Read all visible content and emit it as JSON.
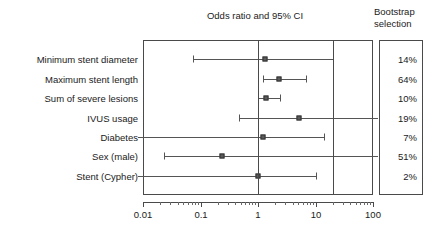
{
  "chart_data": {
    "type": "scatter",
    "subtype": "forest-plot",
    "title": "Odds ratio and 95% CI",
    "xlabel": "",
    "ylabel": "",
    "xscale": "log",
    "xlim": [
      0.01,
      100
    ],
    "xticks": [
      0.01,
      0.1,
      1,
      10,
      100
    ],
    "xtick_labels": [
      "0.01",
      "0.1",
      "1",
      "10",
      "100"
    ],
    "grid": false,
    "legend": "none",
    "reference_line": 1,
    "extra_vertical_line": 20,
    "side_column_title_line1": "Bootstrap",
    "side_column_title_line2": "selection",
    "side_column_header": "Bootstrap selection",
    "categories": [
      "Minimum stent diameter",
      "Maximum stent length",
      "Sum of severe lesions",
      "IVUS usage",
      "Diabetes",
      "Sex (male)",
      "Stent (Cypher)"
    ],
    "rows": [
      {
        "label": "Minimum stent diameter",
        "odds_ratio": 1.3,
        "ci_low": 0.073,
        "ci_high": 20.0,
        "ci_low_clipped": false,
        "ci_high_clipped": false,
        "bootstrap_selection": "14%"
      },
      {
        "label": "Maximum stent length",
        "odds_ratio": 2.3,
        "ci_low": 1.2,
        "ci_high": 6.8,
        "ci_low_clipped": false,
        "ci_high_clipped": false,
        "bootstrap_selection": "64%"
      },
      {
        "label": "Sum of severe lesions",
        "odds_ratio": 1.4,
        "ci_low": 1.0,
        "ci_high": 2.4,
        "ci_low_clipped": false,
        "ci_high_clipped": false,
        "bootstrap_selection": "10%"
      },
      {
        "label": "IVUS usage",
        "odds_ratio": 5.2,
        "ci_low": 0.47,
        "ci_high": 100.0,
        "ci_low_clipped": false,
        "ci_high_clipped": true,
        "bootstrap_selection": "19%"
      },
      {
        "label": "Diabetes",
        "odds_ratio": 1.2,
        "ci_low": 0.01,
        "ci_high": 14.0,
        "ci_low_clipped": true,
        "ci_high_clipped": false,
        "bootstrap_selection": "7%"
      },
      {
        "label": "Sex (male)",
        "odds_ratio": 0.24,
        "ci_low": 0.023,
        "ci_high": 100.0,
        "ci_low_clipped": false,
        "ci_high_clipped": true,
        "bootstrap_selection": "51%"
      },
      {
        "label": "Stent (Cypher)",
        "odds_ratio": 1.0,
        "ci_low": 0.0085,
        "ci_high": 10.0,
        "ci_low_clipped": true,
        "ci_high_clipped": false,
        "bootstrap_selection": "2%"
      }
    ],
    "colors": {
      "frame": "#4a4a4a",
      "marker": "#5a5a5a",
      "ci": "#555555",
      "text": "#1a1a1a",
      "background": "#ffffff"
    }
  }
}
